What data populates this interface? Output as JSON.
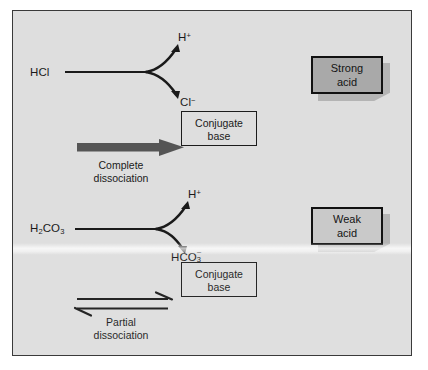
{
  "figure": {
    "background_color": "#dedede",
    "frame_color": "#3a3a3a"
  },
  "reactions": [
    {
      "id": "strong-acid-reaction",
      "reactant": "HCl",
      "products": {
        "proton": "H",
        "proton_charge": "+",
        "anion": "Cl",
        "anion_charge": "−"
      },
      "conjugate_base_box": {
        "line1": "Conjugate",
        "line2": "base"
      },
      "arrow": {
        "type": "single-thick-right",
        "color": "#555555"
      },
      "caption": {
        "line1": "Complete",
        "line2": "dissociation"
      },
      "classification": {
        "line1": "Strong",
        "line2": "acid",
        "fill": "#a9a9a9",
        "border": "#111111",
        "shadow": "#b4b4b4"
      }
    },
    {
      "id": "weak-acid-reaction",
      "reactant_formula": "H",
      "reactant_sub1": "2",
      "reactant_mid": "CO",
      "reactant_sub2": "3",
      "products": {
        "proton": "H",
        "proton_charge": "+",
        "anion": "HCO",
        "anion_sub": "3",
        "anion_charge": "−"
      },
      "conjugate_base_box": {
        "line1": "Conjugate",
        "line2": "base"
      },
      "arrow": {
        "type": "equilibrium-double",
        "color": "#1a1a1a"
      },
      "caption": {
        "line1": "Partial",
        "line2": "dissociation"
      },
      "classification": {
        "line1": "Weak",
        "line2": "acid",
        "fill": "#c9c9c9",
        "border": "#111111",
        "shadow": "#b4b4b4"
      }
    }
  ]
}
